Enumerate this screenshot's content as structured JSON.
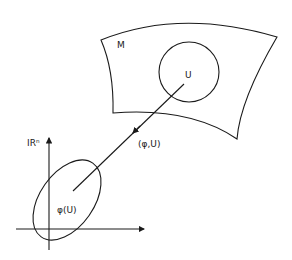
{
  "diagram": {
    "labels": {
      "manifold": "M",
      "open_set": "U",
      "chart": "(φ,U)",
      "image": "φ(U)",
      "space": "IRⁿ"
    },
    "colors": {
      "ink": "#1a1a1a",
      "background": "#ffffff"
    }
  }
}
